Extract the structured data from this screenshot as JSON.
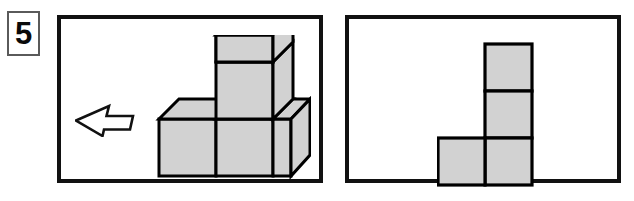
{
  "question": {
    "number": "5",
    "type": "spatial-reasoning-cube-view"
  },
  "colors": {
    "panel_border": "#111111",
    "number_box_border": "#5a5a5a",
    "shape_fill": "#d2d2d2",
    "shape_outline": "#000000",
    "background": "#ffffff",
    "text": "#0a0a0a"
  },
  "panels": {
    "left": {
      "name": "stimulus-panel",
      "arrow": {
        "icon": "right-arrow-outline-icon",
        "direction": "right",
        "style": "hollow-outline",
        "meaning": "view direction"
      },
      "figure": {
        "icon": "isometric-cube-stack-icon",
        "kind": "3d-isometric-cube-assembly",
        "cube_count": 5,
        "description": "Three cubes in a bottom row with two cubes stacked on the middle cube",
        "layout": {
          "bottom_row": 3,
          "stack_on_middle": 2,
          "total_height_units": 3
        }
      }
    },
    "right": {
      "name": "answer-panel",
      "figure": {
        "icon": "j-tetromino-icon",
        "kind": "2d-square-grid-figure",
        "square_count": 4,
        "description": "Three squares in a vertical right column with one square attached at the bottom left",
        "grid": [
          [
            0,
            1
          ],
          [
            0,
            1
          ],
          [
            1,
            1
          ]
        ],
        "columns": 2,
        "rows": 3
      }
    }
  },
  "geometry": {
    "cube_unit_px": 57,
    "iso_depth_x_px": 20,
    "iso_depth_y_px": -15,
    "flat_square_px": 47
  }
}
